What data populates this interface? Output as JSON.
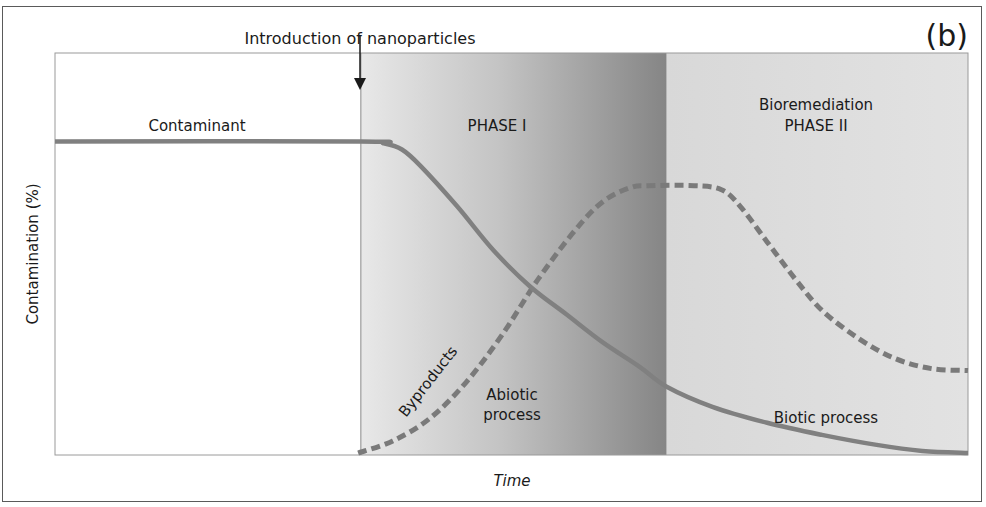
{
  "panel_label": "(b)",
  "annotation": {
    "text": "Introduction of nanoparticles"
  },
  "chart_data": {
    "type": "line",
    "title": "",
    "xlabel": "Time",
    "ylabel": "Contamination (%)",
    "xlim": [
      0,
      100
    ],
    "ylim": [
      0,
      100
    ],
    "grid": false,
    "legend": "none",
    "regions": [
      {
        "name": "pre-treatment",
        "label": "",
        "x_start": 0,
        "x_end": 33.5,
        "fill": "#ffffff"
      },
      {
        "name": "phase-1",
        "label": "PHASE I",
        "x_start": 33.5,
        "x_end": 67,
        "fill_from": "#e6e6e6",
        "fill_to": "#8a8a8a"
      },
      {
        "name": "phase-2",
        "label": "Bioremediation\nPHASE II",
        "x_start": 67,
        "x_end": 100,
        "fill": "#dcdcdc"
      }
    ],
    "event_marker": {
      "x": 33.5,
      "label": "Introduction of nanoparticles"
    },
    "series": [
      {
        "name": "Contaminant",
        "style": "solid",
        "color": "#808080",
        "points": [
          [
            0,
            78
          ],
          [
            33.5,
            78
          ],
          [
            36,
            77.5
          ],
          [
            38,
            76
          ],
          [
            40,
            72
          ],
          [
            44,
            62
          ],
          [
            48,
            51
          ],
          [
            52,
            42
          ],
          [
            56,
            35
          ],
          [
            60,
            28
          ],
          [
            64,
            22
          ],
          [
            67,
            17
          ],
          [
            72,
            12
          ],
          [
            78,
            8
          ],
          [
            84,
            5
          ],
          [
            90,
            2.5
          ],
          [
            95,
            1
          ],
          [
            100,
            0.5
          ]
        ]
      },
      {
        "name": "Byproducts",
        "style": "dashed",
        "color": "#7a7a7a",
        "points": [
          [
            33.2,
            0.5
          ],
          [
            37,
            3.5
          ],
          [
            41,
            9
          ],
          [
            45,
            18
          ],
          [
            49,
            30
          ],
          [
            53,
            44
          ],
          [
            57,
            56
          ],
          [
            60,
            63
          ],
          [
            63,
            66.5
          ],
          [
            65,
            67
          ],
          [
            70,
            67
          ],
          [
            73,
            66
          ],
          [
            75,
            62
          ],
          [
            78,
            53
          ],
          [
            81,
            44
          ],
          [
            84,
            36
          ],
          [
            88,
            29
          ],
          [
            92,
            24
          ],
          [
            96,
            21.5
          ],
          [
            100,
            21
          ]
        ]
      }
    ],
    "annotations": [
      {
        "text": "Contaminant",
        "near": "contaminant-plateau"
      },
      {
        "text": "Byproducts",
        "near": "byproducts-rising",
        "rotation_deg": -52
      },
      {
        "text": "Abiotic\nprocess",
        "region": "phase-1"
      },
      {
        "text": "Biotic process",
        "region": "phase-2"
      }
    ]
  },
  "labels": {
    "contaminant": "Contaminant",
    "phase1": "PHASE I",
    "phase2_line1": "Bioremediation",
    "phase2_line2": "PHASE II",
    "byproducts": "Byproducts",
    "abiotic_line1": "Abiotic",
    "abiotic_line2": "process",
    "biotic": "Biotic process",
    "xlabel": "Time",
    "ylabel": "Contamination (%)"
  }
}
